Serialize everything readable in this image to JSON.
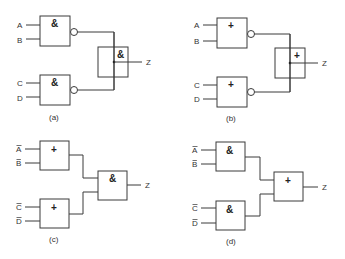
{
  "panels": [
    {
      "id": "a",
      "caption": "(a)",
      "inputs": [
        "A",
        "B",
        "C",
        "D"
      ],
      "input_inverted": false,
      "gate1_symbol": "&",
      "gate2_symbol": "&",
      "output_gate_symbol": "&",
      "gates_inverted_outputs": true,
      "output_gate_style": "junction-through",
      "output": "Z"
    },
    {
      "id": "b",
      "caption": "(b)",
      "inputs": [
        "A",
        "B",
        "C",
        "D"
      ],
      "input_inverted": false,
      "gate1_symbol": "+",
      "gate2_symbol": "+",
      "output_gate_symbol": "+",
      "gates_inverted_outputs": true,
      "output_gate_style": "junction-through",
      "output": "Z"
    },
    {
      "id": "c",
      "caption": "(c)",
      "inputs": [
        "A",
        "B",
        "C",
        "D"
      ],
      "input_inverted": true,
      "gate1_symbol": "+",
      "gate2_symbol": "+",
      "output_gate_symbol": "&",
      "gates_inverted_outputs": false,
      "output_gate_style": "standard",
      "output": "Z"
    },
    {
      "id": "d",
      "caption": "(d)",
      "inputs": [
        "A",
        "B",
        "C",
        "D"
      ],
      "input_inverted": true,
      "gate1_symbol": "&",
      "gate2_symbol": "&",
      "output_gate_symbol": "+",
      "gates_inverted_outputs": false,
      "output_gate_style": "standard",
      "output": "Z"
    }
  ]
}
